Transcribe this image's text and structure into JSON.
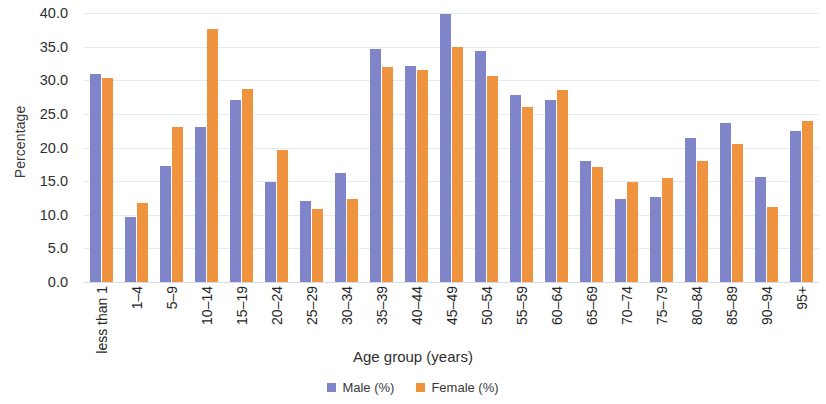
{
  "chart_data": {
    "type": "bar",
    "title": "",
    "xlabel": "Age group (years)",
    "ylabel": "Percentage",
    "ylim": [
      0.0,
      40.0
    ],
    "ytick_step": 5.0,
    "yticks": [
      "40.0",
      "35.0",
      "30.0",
      "25.0",
      "20.0",
      "15.0",
      "10.0",
      "5.0",
      "0.0"
    ],
    "ytick_values": [
      40.0,
      35.0,
      30.0,
      25.0,
      20.0,
      15.0,
      10.0,
      5.0,
      0.0
    ],
    "grid": true,
    "legend_position": "bottom-center",
    "categories": [
      "less than 1",
      "1–4",
      "5–9",
      "10–14",
      "15–19",
      "20–24",
      "25–29",
      "30–34",
      "35–39",
      "40–44",
      "45–49",
      "50–54",
      "55–59",
      "60–64",
      "65–69",
      "70–74",
      "75–79",
      "80–84",
      "85–89",
      "90–94",
      "95+"
    ],
    "series": [
      {
        "name": "Male (%)",
        "color": "#8084c8",
        "values": [
          30.9,
          9.7,
          17.3,
          23.0,
          27.0,
          14.8,
          12.0,
          16.2,
          34.6,
          32.1,
          39.9,
          34.4,
          27.8,
          27.0,
          18.0,
          12.4,
          12.7,
          21.4,
          23.7,
          15.6,
          22.5
        ]
      },
      {
        "name": "Female (%)",
        "color": "#f0933f",
        "values": [
          30.4,
          11.8,
          23.0,
          37.6,
          28.7,
          19.6,
          10.8,
          12.3,
          32.0,
          31.6,
          35.0,
          30.6,
          26.0,
          28.6,
          17.1,
          14.9,
          15.4,
          18.0,
          20.5,
          11.2,
          24.0
        ]
      }
    ],
    "legend": [
      "Male (%)",
      "Female (%)"
    ]
  }
}
